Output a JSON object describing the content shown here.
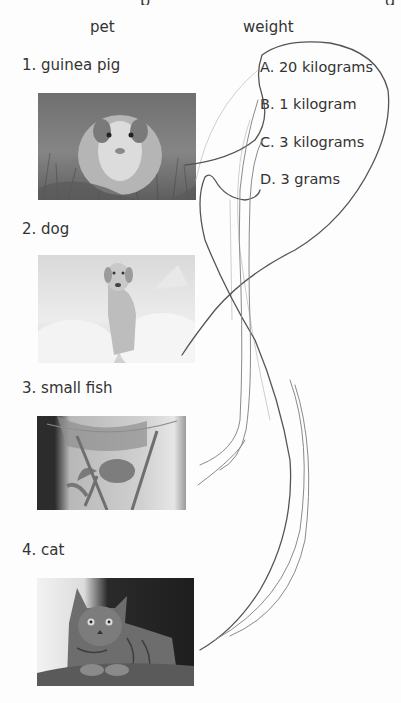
{
  "worksheet": {
    "column_headers": {
      "pet": "pet",
      "weight": "weight"
    },
    "pets": [
      {
        "label": "1. guinea pig",
        "image": "guinea-pig-photo"
      },
      {
        "label": "2. dog",
        "image": "dog-photo"
      },
      {
        "label": "3. small fish",
        "image": "small-fish-photo"
      },
      {
        "label": "4. cat",
        "image": "cat-photo"
      }
    ],
    "weights": [
      {
        "label": "A. 20 kilograms"
      },
      {
        "label": "B. 1 kilogram"
      },
      {
        "label": "C. 3 kilograms"
      },
      {
        "label": "D. 3 grams"
      }
    ],
    "annotation": "hand-drawn pencil matching lines"
  }
}
